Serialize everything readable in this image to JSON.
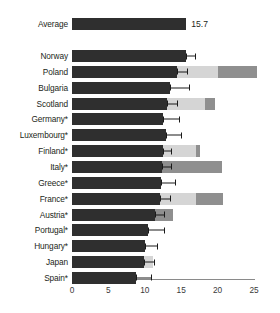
{
  "chart_data": {
    "type": "bar",
    "orientation": "horizontal",
    "title": "",
    "subtitle": "",
    "xlabel": "",
    "ylabel": "",
    "xlim": [
      0,
      25
    ],
    "xticks": [
      0,
      5,
      10,
      15,
      20,
      25
    ],
    "xticklabels": [
      "0",
      "5",
      "10",
      "15",
      "20",
      "25"
    ],
    "grid": false,
    "legend": "none",
    "value_label_precision": 1,
    "colors": {
      "dark": "#2f2f2f",
      "mid": "#8f8f8f",
      "light": "#d5d5d5",
      "error_bar": "#1a1a1a",
      "axis": "#8a8a8a",
      "text": "#231f20",
      "background": "#ffffff"
    },
    "footnote_marker": "*",
    "summary": {
      "label": "Average",
      "value": 15.7,
      "value_label": "15.7",
      "segments": [
        {
          "shade": "dark",
          "start": 0,
          "end": 15.7
        }
      ],
      "error": null
    },
    "categories": [
      "Norway",
      "Poland",
      "Bulgaria",
      "Scotland",
      "Germany*",
      "Luxembourg*",
      "Finland*",
      "Italy*",
      "Greece*",
      "France*",
      "Austria*",
      "Portugal*",
      "Hungary*",
      "Japan",
      "Spain*"
    ],
    "values": [
      15.6,
      14.4,
      13.5,
      13.1,
      12.5,
      12.9,
      12.5,
      12.4,
      12.2,
      12.1,
      11.4,
      10.4,
      10.0,
      9.9,
      8.8
    ],
    "rows": [
      {
        "label": "Norway",
        "segments": [
          {
            "shade": "dark",
            "start": 0,
            "end": 15.6
          }
        ],
        "error": {
          "low": 15.6,
          "high": 17.1
        }
      },
      {
        "label": "Poland",
        "segments": [
          {
            "shade": "dark",
            "start": 0,
            "end": 14.4
          },
          {
            "shade": "light",
            "start": 14.4,
            "end": 20.0
          },
          {
            "shade": "mid",
            "start": 20.0,
            "end": 25.4
          }
        ],
        "error": {
          "low": 14.4,
          "high": 15.9
        }
      },
      {
        "label": "Bulgaria",
        "segments": [
          {
            "shade": "dark",
            "start": 0,
            "end": 13.5
          }
        ],
        "error": {
          "low": 13.5,
          "high": 16.2
        }
      },
      {
        "label": "Scotland",
        "segments": [
          {
            "shade": "dark",
            "start": 0,
            "end": 13.1
          },
          {
            "shade": "light",
            "start": 13.1,
            "end": 18.3
          },
          {
            "shade": "mid",
            "start": 18.3,
            "end": 19.6
          }
        ],
        "error": {
          "low": 13.1,
          "high": 14.6
        }
      },
      {
        "label": "Germany*",
        "segments": [
          {
            "shade": "dark",
            "start": 0,
            "end": 12.5
          }
        ],
        "error": {
          "low": 12.5,
          "high": 14.8
        }
      },
      {
        "label": "Luxembourg*",
        "segments": [
          {
            "shade": "dark",
            "start": 0,
            "end": 12.9
          }
        ],
        "error": {
          "low": 12.9,
          "high": 15.1
        }
      },
      {
        "label": "Finland*",
        "segments": [
          {
            "shade": "dark",
            "start": 0,
            "end": 12.5
          },
          {
            "shade": "light",
            "start": 12.5,
            "end": 17.0
          },
          {
            "shade": "mid",
            "start": 17.0,
            "end": 17.6
          }
        ],
        "error": {
          "low": 12.5,
          "high": 13.7
        }
      },
      {
        "label": "Italy*",
        "segments": [
          {
            "shade": "dark",
            "start": 0,
            "end": 12.4
          },
          {
            "shade": "mid",
            "start": 12.4,
            "end": 20.6
          }
        ],
        "error": {
          "low": 12.4,
          "high": 13.7
        }
      },
      {
        "label": "Greece*",
        "segments": [
          {
            "shade": "dark",
            "start": 0,
            "end": 12.2
          }
        ],
        "error": {
          "low": 12.2,
          "high": 14.3
        }
      },
      {
        "label": "France*",
        "segments": [
          {
            "shade": "dark",
            "start": 0,
            "end": 12.1
          },
          {
            "shade": "light",
            "start": 12.1,
            "end": 17.0
          },
          {
            "shade": "mid",
            "start": 17.0,
            "end": 20.7
          }
        ],
        "error": {
          "low": 12.1,
          "high": 13.6
        }
      },
      {
        "label": "Austria*",
        "segments": [
          {
            "shade": "dark",
            "start": 0,
            "end": 11.4
          },
          {
            "shade": "mid",
            "start": 11.4,
            "end": 13.9
          }
        ],
        "error": {
          "low": 11.4,
          "high": 12.8
        }
      },
      {
        "label": "Portugal*",
        "segments": [
          {
            "shade": "dark",
            "start": 0,
            "end": 10.4
          }
        ],
        "error": {
          "low": 10.4,
          "high": 12.8
        }
      },
      {
        "label": "Hungary*",
        "segments": [
          {
            "shade": "dark",
            "start": 0,
            "end": 10.0
          }
        ],
        "error": {
          "low": 10.0,
          "high": 11.8
        }
      },
      {
        "label": "Japan",
        "segments": [
          {
            "shade": "dark",
            "start": 0,
            "end": 9.9
          },
          {
            "shade": "light",
            "start": 9.9,
            "end": 11.1
          }
        ],
        "error": {
          "low": 9.9,
          "high": 11.4
        }
      },
      {
        "label": "Spain*",
        "segments": [
          {
            "shade": "dark",
            "start": 0,
            "end": 8.8
          }
        ],
        "error": {
          "low": 8.8,
          "high": 11.0
        }
      }
    ]
  }
}
